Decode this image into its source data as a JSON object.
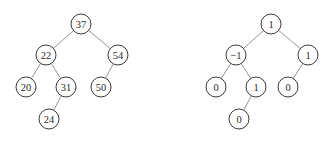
{
  "node_radius": 10,
  "trees": [
    {
      "name": "bst-keys",
      "nodes": [
        {
          "id": "a",
          "label": "37",
          "x": 81,
          "y": 24
        },
        {
          "id": "b",
          "label": "22",
          "x": 46,
          "y": 55
        },
        {
          "id": "c",
          "label": "54",
          "x": 118,
          "y": 55
        },
        {
          "id": "d",
          "label": "20",
          "x": 26,
          "y": 87
        },
        {
          "id": "e",
          "label": "31",
          "x": 66,
          "y": 87
        },
        {
          "id": "f",
          "label": "50",
          "x": 101,
          "y": 87
        },
        {
          "id": "g",
          "label": "24",
          "x": 49,
          "y": 119
        }
      ],
      "edges": [
        [
          "a",
          "b"
        ],
        [
          "a",
          "c"
        ],
        [
          "b",
          "d"
        ],
        [
          "b",
          "e"
        ],
        [
          "c",
          "f"
        ],
        [
          "e",
          "g"
        ]
      ]
    },
    {
      "name": "balance-factors",
      "nodes": [
        {
          "id": "a",
          "label": "1",
          "x": 271,
          "y": 24
        },
        {
          "id": "b",
          "label": "−1",
          "x": 236,
          "y": 55
        },
        {
          "id": "c",
          "label": "1",
          "x": 308,
          "y": 55
        },
        {
          "id": "d",
          "label": "0",
          "x": 216,
          "y": 87
        },
        {
          "id": "e",
          "label": "1",
          "x": 256,
          "y": 87
        },
        {
          "id": "f",
          "label": "0",
          "x": 288,
          "y": 87
        },
        {
          "id": "g",
          "label": "0",
          "x": 239,
          "y": 119
        }
      ],
      "edges": [
        [
          "a",
          "b"
        ],
        [
          "a",
          "c"
        ],
        [
          "b",
          "d"
        ],
        [
          "b",
          "e"
        ],
        [
          "c",
          "f"
        ],
        [
          "e",
          "g"
        ]
      ]
    }
  ]
}
